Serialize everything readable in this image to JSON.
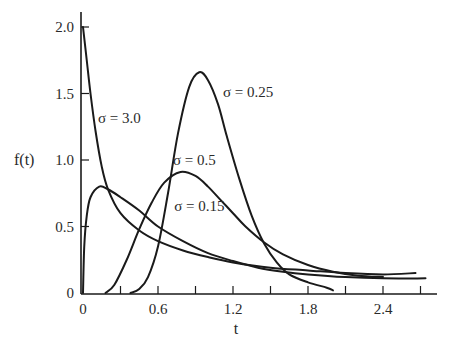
{
  "chart_data": {
    "type": "line",
    "title": "",
    "xlabel": "t",
    "ylabel": "f(t)",
    "xlim": [
      0,
      2.85
    ],
    "ylim": [
      0,
      2.1
    ],
    "grid": false,
    "legend": "inline labels",
    "x_ticks": [
      {
        "value": 0,
        "label": "0"
      },
      {
        "value": 0.3,
        "label": ""
      },
      {
        "value": 0.6,
        "label": "0.6"
      },
      {
        "value": 0.9,
        "label": ""
      },
      {
        "value": 1.2,
        "label": "1.2"
      },
      {
        "value": 1.5,
        "label": ""
      },
      {
        "value": 1.8,
        "label": "1.8"
      },
      {
        "value": 2.1,
        "label": ""
      },
      {
        "value": 2.4,
        "label": "2.4"
      },
      {
        "value": 2.7,
        "label": ""
      }
    ],
    "y_ticks": [
      {
        "value": 0,
        "label": "0"
      },
      {
        "value": 0.5,
        "label": "0.5"
      },
      {
        "value": 1.0,
        "label": "1.0"
      },
      {
        "value": 1.5,
        "label": "1.5"
      },
      {
        "value": 2.0,
        "label": "2.0"
      }
    ],
    "series": [
      {
        "name": "σ = 3.0",
        "label_pos": [
          0.12,
          1.28
        ],
        "points": [
          [
            0,
            2.0
          ],
          [
            0.03,
            1.75
          ],
          [
            0.06,
            1.5
          ],
          [
            0.1,
            1.22
          ],
          [
            0.15,
            0.95
          ],
          [
            0.2,
            0.78
          ],
          [
            0.3,
            0.6
          ],
          [
            0.45,
            0.47
          ],
          [
            0.6,
            0.39
          ],
          [
            0.8,
            0.32
          ],
          [
            1.0,
            0.27
          ],
          [
            1.2,
            0.23
          ],
          [
            1.5,
            0.19
          ],
          [
            1.8,
            0.17
          ],
          [
            2.1,
            0.15
          ],
          [
            2.4,
            0.14
          ],
          [
            2.66,
            0.15
          ]
        ]
      },
      {
        "name": "σ = 0.15",
        "label_pos": [
          0.73,
          0.62
        ],
        "points": [
          [
            0,
            0
          ],
          [
            0.01,
            0.35
          ],
          [
            0.03,
            0.58
          ],
          [
            0.06,
            0.72
          ],
          [
            0.13,
            0.8
          ],
          [
            0.2,
            0.78
          ],
          [
            0.3,
            0.72
          ],
          [
            0.45,
            0.62
          ],
          [
            0.6,
            0.5
          ],
          [
            0.8,
            0.39
          ],
          [
            1.0,
            0.3
          ],
          [
            1.2,
            0.24
          ],
          [
            1.4,
            0.19
          ],
          [
            1.6,
            0.16
          ],
          [
            1.8,
            0.14
          ],
          [
            2.1,
            0.12
          ],
          [
            2.4,
            0.11
          ],
          [
            2.74,
            0.11
          ]
        ]
      },
      {
        "name": "σ = 0.5",
        "label_pos": [
          0.72,
          0.96
        ],
        "points": [
          [
            0.18,
            0
          ],
          [
            0.25,
            0.06
          ],
          [
            0.35,
            0.25
          ],
          [
            0.45,
            0.48
          ],
          [
            0.55,
            0.68
          ],
          [
            0.65,
            0.83
          ],
          [
            0.78,
            0.91
          ],
          [
            0.9,
            0.88
          ],
          [
            1.0,
            0.8
          ],
          [
            1.1,
            0.7
          ],
          [
            1.2,
            0.6
          ],
          [
            1.3,
            0.5
          ],
          [
            1.45,
            0.38
          ],
          [
            1.6,
            0.29
          ],
          [
            1.8,
            0.21
          ],
          [
            2.0,
            0.16
          ],
          [
            2.2,
            0.13
          ],
          [
            2.4,
            0.12
          ]
        ]
      },
      {
        "name": "σ = 0.25",
        "label_pos": [
          1.12,
          1.47
        ],
        "points": [
          [
            0.38,
            0
          ],
          [
            0.45,
            0.03
          ],
          [
            0.52,
            0.12
          ],
          [
            0.6,
            0.35
          ],
          [
            0.68,
            0.75
          ],
          [
            0.76,
            1.2
          ],
          [
            0.85,
            1.55
          ],
          [
            0.93,
            1.66
          ],
          [
            1.0,
            1.6
          ],
          [
            1.08,
            1.42
          ],
          [
            1.15,
            1.18
          ],
          [
            1.25,
            0.86
          ],
          [
            1.35,
            0.58
          ],
          [
            1.45,
            0.37
          ],
          [
            1.55,
            0.23
          ],
          [
            1.65,
            0.14
          ],
          [
            1.8,
            0.08
          ],
          [
            1.95,
            0.04
          ],
          [
            2.0,
            0.02
          ]
        ]
      }
    ]
  },
  "plot_area": {
    "x0_px": 83,
    "y0_px": 293,
    "px_per_x": 125,
    "px_per_y": 133
  }
}
